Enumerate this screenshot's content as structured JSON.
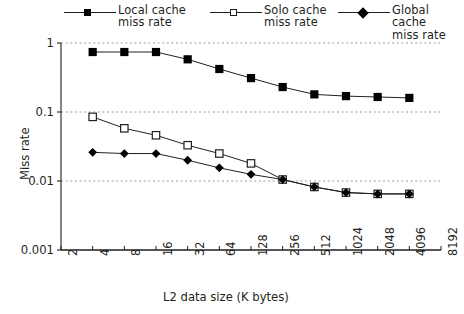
{
  "chart_data": {
    "type": "line",
    "title": "",
    "xlabel": "L2 data size (K bytes)",
    "ylabel": "Miss rate",
    "xscale": "log2",
    "yscale": "log10",
    "grid": true,
    "legend_position": "top",
    "x_tick_labels": [
      "2",
      "4",
      "8",
      "16",
      "32",
      "64",
      "128",
      "256",
      "512",
      "1024",
      "2048",
      "4096",
      "8192"
    ],
    "y_tick_labels": [
      "1",
      "0.1",
      "0.01",
      "0.001"
    ],
    "y_ticks": [
      1,
      0.1,
      0.01,
      0.001
    ],
    "ylim": [
      0.001,
      1
    ],
    "xlim": [
      2,
      8192
    ],
    "x": [
      4,
      8,
      16,
      32,
      64,
      128,
      256,
      512,
      1024,
      2048,
      4096
    ],
    "series": [
      {
        "name": "Local cache miss rate",
        "marker": "filled-square",
        "color": "#000000",
        "values": [
          0.74,
          0.74,
          0.74,
          0.58,
          0.42,
          0.31,
          0.23,
          0.18,
          0.17,
          0.165,
          0.16
        ]
      },
      {
        "name": "Solo cache miss rate",
        "marker": "open-square",
        "color": "#231f20",
        "values": [
          0.085,
          0.058,
          0.046,
          0.033,
          0.025,
          0.018,
          0.0105,
          0.0082,
          0.0068,
          0.0065,
          0.0065
        ]
      },
      {
        "name": "Global cache miss rate",
        "marker": "filled-diamond",
        "color": "#000000",
        "values": [
          0.026,
          0.025,
          0.025,
          0.02,
          0.0155,
          0.0125,
          0.0105,
          0.0082,
          0.0068,
          0.0065,
          0.0065
        ]
      }
    ]
  },
  "legend": {
    "entries": [
      {
        "label": "Local cache\nmiss rate",
        "marker": "filled-square"
      },
      {
        "label": "Solo cache\nmiss rate",
        "marker": "open-square"
      },
      {
        "label": "Global cache\nmiss rate",
        "marker": "filled-diamond"
      }
    ]
  },
  "axes": {
    "y_title": "Miss rate",
    "x_title": "L2 data size (K bytes)",
    "y_labels": [
      "1",
      "0.1",
      "0.01",
      "0.001"
    ],
    "x_labels": [
      "2",
      "4",
      "8",
      "16",
      "32",
      "64",
      "128",
      "256",
      "512",
      "1024",
      "2048",
      "4096",
      "8192"
    ]
  },
  "colors": {
    "ink": "#231f20",
    "grid": "#9a9a9a",
    "marker_fill": "#000000",
    "marker_open": "#ffffff"
  }
}
